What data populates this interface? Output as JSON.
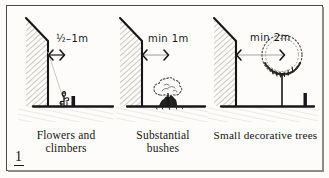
{
  "figure": {
    "number": "1",
    "kind": "planting-distance-diagram"
  },
  "panels": [
    {
      "id": "flowers-and-climbers",
      "dimension": "½–1m",
      "caption": "Flowers  and\nclimbers",
      "plant": "small-flower",
      "wall": "hatched-wall-angled-top"
    },
    {
      "id": "substantial-bushes",
      "dimension": "min 1m",
      "caption": "Substantial\nbushes",
      "plant": "stippled-bush",
      "wall": "hatched-wall-angled-top"
    },
    {
      "id": "small-decorative-trees",
      "dimension": "min 2m",
      "caption": "Small decorative trees",
      "plant": "stippled-canopy-tree",
      "wall": "hatched-wall-angled-top"
    }
  ],
  "colors": {
    "ink": "#141412",
    "wall_hatch": "#9a9a93",
    "ground": "#1b1b19",
    "paper": "#fdfcfa",
    "frame": "#4a4a46"
  }
}
